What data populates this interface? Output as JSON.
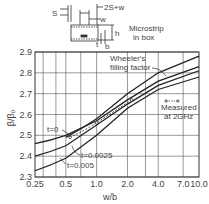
{
  "inset": {
    "labels": {
      "s": "S",
      "span": "2S+w",
      "w": "w",
      "h": "h",
      "t": "t",
      "b": "b"
    },
    "caption_line1": "Microstrip",
    "caption_line2": "in box"
  },
  "chart_data": {
    "type": "line",
    "title": "",
    "xlabel": "w/b",
    "ylabel": "β/β₀",
    "xscale": "log",
    "xlim": [
      0.25,
      10.0
    ],
    "ylim": [
      2.3,
      2.9
    ],
    "xticks": [
      0.25,
      0.5,
      1.0,
      2.0,
      4.0,
      7.0,
      10.0
    ],
    "xtick_labels": [
      "0.25",
      "0.5",
      "1.0",
      "2.0",
      "4.0",
      "7.0",
      "10.0"
    ],
    "xgrid": [
      0.3,
      0.4,
      0.5,
      0.7,
      1.0,
      2.0,
      3.0,
      4.0,
      7.0
    ],
    "yticks": [
      2.3,
      2.4,
      2.5,
      2.6,
      2.7,
      2.8,
      2.9
    ],
    "ytick_labels": [
      "2.3",
      "2.4",
      "2.5",
      "2.6",
      "2.7",
      "2.8",
      "2.9"
    ],
    "grid": true,
    "series": [
      {
        "name": "t=0",
        "style": "solid",
        "x": [
          0.25,
          0.5,
          1.0,
          2.0,
          4.0,
          10.0
        ],
        "y": [
          2.46,
          2.5,
          2.57,
          2.67,
          2.76,
          2.83
        ]
      },
      {
        "name": "t=0.0025",
        "style": "solid",
        "x": [
          0.25,
          0.5,
          1.0,
          2.0,
          4.0,
          10.0
        ],
        "y": [
          2.4,
          2.45,
          2.55,
          2.65,
          2.74,
          2.81
        ]
      },
      {
        "name": "t=0.005",
        "style": "solid",
        "x": [
          0.25,
          0.5,
          1.0,
          2.0,
          4.0,
          10.0
        ],
        "y": [
          2.33,
          2.39,
          2.5,
          2.63,
          2.72,
          2.78
        ]
      },
      {
        "name": "Wheeler's filling factor",
        "style": "solid",
        "x": [
          0.5,
          1.0,
          2.0,
          4.0,
          10.0
        ],
        "y": [
          2.49,
          2.58,
          2.7,
          2.8,
          2.88
        ]
      },
      {
        "name": "Measured at 2GHz",
        "style": "dashed",
        "x": [
          0.55,
          1.0,
          2.2
        ],
        "y": [
          2.49,
          2.56,
          2.67
        ]
      }
    ],
    "annotations": [
      {
        "text": "Wheeler's",
        "text2": "filling factor"
      },
      {
        "text": "Measured",
        "text2": "at 2GHz"
      },
      {
        "text": "t=0"
      },
      {
        "text": "t=0.0025"
      },
      {
        "text": "t=0.005"
      }
    ]
  }
}
